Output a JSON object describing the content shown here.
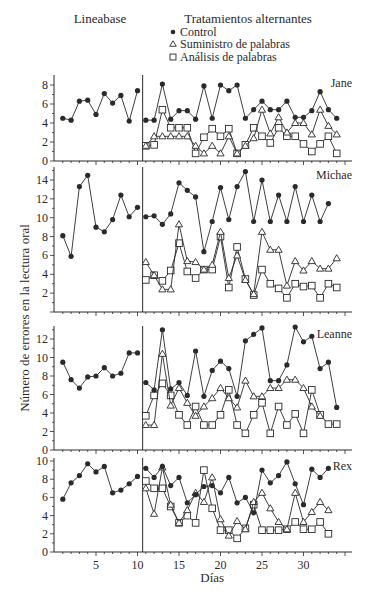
{
  "chart_data": {
    "type": "line",
    "title": "",
    "phases": {
      "baseline_label": "Lineabase",
      "treatment_label": "Tratamientos alternantes"
    },
    "legend": [
      {
        "key": "control",
        "label": "Control",
        "marker": "filled-circle"
      },
      {
        "key": "supply",
        "label": "Suministro de palabras",
        "marker": "open-triangle"
      },
      {
        "key": "analysis",
        "label": "Análisis de palabras",
        "marker": "open-square"
      }
    ],
    "xlabel": "Días",
    "ylabel": "Número de errores en la lectura oral",
    "x_ticks": [
      5,
      10,
      15,
      20,
      25,
      30
    ],
    "phase_change_after_day": 10.5,
    "panels": [
      {
        "name": "Jane",
        "ylim": [
          0,
          8
        ],
        "y_ticks": [
          0,
          2,
          4,
          6,
          8
        ],
        "baseline": {
          "days": [
            1,
            2,
            3,
            4,
            5,
            6,
            7,
            8,
            9,
            10
          ],
          "control": [
            4.5,
            4.3,
            6.3,
            6.4,
            4.9,
            7.1,
            6.1,
            6.9,
            4.2,
            7.4
          ]
        },
        "treatment": {
          "control": {
            "days": [
              11,
              12,
              13,
              14,
              15,
              16,
              17,
              18,
              19,
              20,
              21,
              22,
              23,
              24,
              25,
              26,
              27,
              28,
              29,
              30,
              31,
              32,
              33,
              34
            ],
            "values": [
              4.3,
              4.3,
              8.1,
              4.4,
              5.3,
              5.3,
              4.4,
              7.9,
              4.5,
              8.0,
              7.4,
              8.0,
              4.5,
              5.4,
              6.3,
              5.4,
              5.4,
              6.3,
              4.6,
              4.6,
              5.3,
              7.3,
              5.4,
              4.5
            ]
          },
          "supply": {
            "days": [
              11,
              12,
              13,
              14,
              15,
              16,
              17,
              18,
              19,
              20,
              21,
              22,
              23,
              24,
              25,
              26,
              27,
              28,
              29,
              30,
              31,
              32,
              33,
              34
            ],
            "values": [
              1.6,
              2.6,
              2.6,
              2.6,
              2.6,
              2.6,
              1.6,
              0.8,
              1.6,
              0.8,
              2.6,
              0.8,
              1.6,
              2.4,
              5.4,
              2.9,
              4.6,
              3.0,
              4.0,
              4.0,
              2.8,
              5.4,
              3.7,
              2.8
            ]
          },
          "analysis": {
            "days": [
              11,
              12,
              13,
              14,
              15,
              16,
              17,
              18,
              19,
              20,
              21,
              22,
              23,
              24,
              25,
              26,
              27,
              28,
              29,
              30,
              31,
              32,
              33,
              34
            ],
            "values": [
              1.6,
              1.7,
              5.4,
              3.5,
              3.5,
              3.5,
              0.8,
              2.5,
              3.4,
              2.6,
              3.4,
              0.8,
              1.7,
              3.5,
              2.6,
              1.9,
              3.5,
              2.6,
              2.6,
              1.8,
              1.0,
              1.8,
              2.6,
              0.8
            ]
          }
        }
      },
      {
        "name": "Michae",
        "ylim": [
          0,
          15
        ],
        "y_ticks": [
          2,
          4,
          6,
          8,
          10,
          12,
          14
        ],
        "baseline": {
          "days": [
            1,
            2,
            3,
            4,
            5,
            6,
            7,
            8,
            9,
            10
          ],
          "control": [
            8.1,
            5.9,
            13.3,
            14.5,
            9.0,
            8.5,
            9.8,
            12.4,
            10.1,
            11.1
          ]
        },
        "treatment": {
          "control": {
            "days": [
              11,
              12,
              13,
              14,
              15,
              16,
              17,
              18,
              19,
              20,
              21,
              22,
              23,
              24,
              25,
              26,
              27,
              28,
              29,
              30,
              31,
              32,
              33,
              34
            ],
            "values": [
              10.1,
              10.2,
              9.3,
              10.4,
              13.7,
              12.9,
              12.2,
              6.4,
              9.6,
              13.2,
              9.8,
              13.3,
              14.9,
              9.6,
              14.0,
              9.6,
              12.4,
              9.6,
              13.3,
              9.6,
              12.4,
              9.6,
              11.5
            ]
          },
          "supply": {
            "days": [
              11,
              12,
              13,
              14,
              15,
              16,
              17,
              18,
              19,
              20,
              21,
              22,
              23,
              24,
              25,
              26,
              27,
              28,
              29,
              30,
              31,
              32,
              33,
              34
            ],
            "values": [
              5.3,
              3.9,
              2.4,
              2.4,
              9.3,
              5.4,
              5.3,
              4.5,
              5.0,
              8.5,
              3.6,
              6.0,
              3.4,
              1.9,
              8.5,
              6.6,
              6.6,
              2.8,
              5.4,
              4.4,
              5.4,
              4.6,
              4.6,
              5.7
            ]
          },
          "analysis": {
            "days": [
              11,
              12,
              13,
              14,
              15,
              16,
              17,
              18,
              19,
              20,
              21,
              22,
              23,
              24,
              25,
              26,
              27,
              28,
              29,
              30,
              31,
              32,
              33,
              34
            ],
            "values": [
              3.4,
              3.9,
              3.3,
              4.4,
              7.3,
              4.3,
              3.6,
              4.5,
              4.5,
              8.0,
              2.6,
              6.9,
              3.5,
              1.8,
              4.5,
              3.0,
              2.5,
              1.5,
              3.0,
              2.7,
              2.8,
              1.5,
              3.0,
              2.6
            ]
          }
        }
      },
      {
        "name": "Leanne",
        "ylim": [
          0,
          13.5
        ],
        "y_ticks": [
          0,
          2,
          4,
          6,
          8,
          10,
          12
        ],
        "baseline": {
          "days": [
            1,
            2,
            3,
            4,
            5,
            6,
            7,
            8,
            9,
            10
          ],
          "control": [
            9.5,
            7.6,
            6.7,
            7.9,
            8.0,
            8.9,
            8.0,
            8.3,
            10.5,
            10.5
          ]
        },
        "treatment": {
          "control": {
            "days": [
              11,
              12,
              13,
              14,
              15,
              16,
              17,
              18,
              19,
              20,
              21,
              22,
              23,
              24,
              25,
              26,
              27,
              28,
              29,
              30,
              31,
              32,
              33,
              34
            ],
            "values": [
              7.3,
              6.5,
              13.0,
              6.6,
              7.3,
              5.9,
              10.7,
              5.8,
              8.6,
              9.6,
              8.8,
              5.8,
              11.8,
              12.5,
              13.2,
              7.5,
              7.5,
              9.2,
              13.3,
              11.7,
              12.3,
              8.8,
              9.5,
              4.6
            ]
          },
          "supply": {
            "days": [
              11,
              12,
              13,
              14,
              15,
              16,
              17,
              18,
              19,
              20,
              21,
              22,
              23,
              24,
              25,
              26,
              27,
              28,
              29,
              30,
              31,
              32,
              33,
              34
            ],
            "values": [
              2.7,
              2.7,
              10.4,
              4.8,
              6.7,
              5.1,
              3.7,
              4.7,
              5.6,
              6.7,
              5.6,
              4.6,
              7.5,
              5.8,
              5.8,
              6.7,
              6.7,
              7.6,
              7.6,
              6.7,
              4.7,
              3.7
            ]
          },
          "analysis": {
            "days": [
              11,
              12,
              13,
              14,
              15,
              16,
              17,
              18,
              19,
              20,
              21,
              22,
              23,
              24,
              25,
              26,
              27,
              28,
              29,
              30,
              31,
              32,
              33,
              34
            ],
            "values": [
              3.7,
              5.9,
              7.2,
              5.9,
              3.8,
              2.7,
              4.7,
              2.7,
              2.7,
              3.8,
              6.5,
              2.7,
              1.8,
              3.8,
              5.1,
              1.8,
              4.7,
              2.7,
              3.9,
              1.8,
              6.5,
              3.8,
              2.8,
              2.8
            ]
          }
        }
      },
      {
        "name": "Rex",
        "ylim": [
          0,
          10
        ],
        "y_ticks": [
          0,
          2,
          4,
          6,
          8,
          10
        ],
        "baseline": {
          "days": [
            1,
            2,
            3,
            4,
            5,
            6,
            7,
            8,
            9,
            10
          ],
          "control": [
            5.8,
            7.6,
            8.4,
            9.7,
            8.8,
            9.4,
            6.5,
            6.8,
            7.5,
            8.3
          ]
        },
        "treatment": {
          "control": {
            "days": [
              11,
              12,
              13,
              14,
              15,
              16,
              17,
              18,
              19,
              20,
              21,
              22,
              23,
              24,
              25,
              26,
              27,
              28,
              29,
              30,
              31,
              32,
              33,
              34
            ],
            "values": [
              9.2,
              8.2,
              9.4,
              7.3,
              8.2,
              5.4,
              6.3,
              7.2,
              7.3,
              6.5,
              8.2,
              5.4,
              6.0,
              4.3,
              9.0,
              7.6,
              8.4,
              9.9,
              7.5,
              5.2,
              9.1,
              8.2,
              9.2
            ]
          },
          "supply": {
            "days": [
              11,
              12,
              13,
              14,
              15,
              16,
              17,
              18,
              19,
              20,
              21,
              22,
              23,
              24,
              25,
              26,
              27,
              28,
              29,
              30,
              31,
              32,
              33,
              34
            ],
            "values": [
              7.0,
              4.2,
              9.3,
              5.2,
              3.2,
              4.6,
              6.5,
              5.5,
              8.2,
              3.6,
              1.8,
              3.4,
              2.5,
              5.5,
              6.5,
              4.8,
              3.3,
              2.5,
              6.5,
              3.3,
              4.4,
              5.5,
              4.6
            ]
          },
          "analysis": {
            "days": [
              11,
              12,
              13,
              14,
              15,
              16,
              17,
              18,
              19,
              20,
              21,
              22,
              23,
              24,
              25,
              26,
              27,
              28,
              29,
              30,
              31,
              32,
              33,
              34
            ],
            "values": [
              7.8,
              7.0,
              7.0,
              5.0,
              3.2,
              4.0,
              3.2,
              9.0,
              4.8,
              2.4,
              2.4,
              1.5,
              2.6,
              5.2,
              2.4,
              2.4,
              2.4,
              2.5,
              3.3,
              2.5,
              2.5,
              3.3,
              2.0
            ]
          }
        }
      }
    ]
  }
}
